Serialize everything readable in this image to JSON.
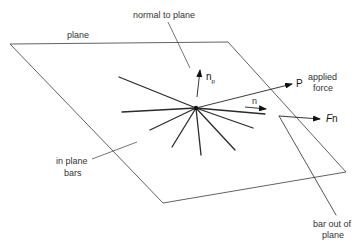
{
  "diagram": {
    "type": "structural-node-in-plane",
    "labels": {
      "plane": "plane",
      "normal_to_plane": "normal to plane",
      "normal_vector": "n",
      "normal_vector_subscript": "p",
      "applied_force_symbol": "P",
      "applied_force_line1": "applied",
      "applied_force_line2": "force",
      "direction_n": "n",
      "force_symbol": "F",
      "force_vector": "n",
      "in_plane_bars_line1": "in plane",
      "in_plane_bars_line2": "bars",
      "bar_out_line1": "bar out of",
      "bar_out_line2": "plane"
    },
    "colors": {
      "line": "#2a2a2a",
      "text": "#333333",
      "background": "#ffffff"
    }
  }
}
